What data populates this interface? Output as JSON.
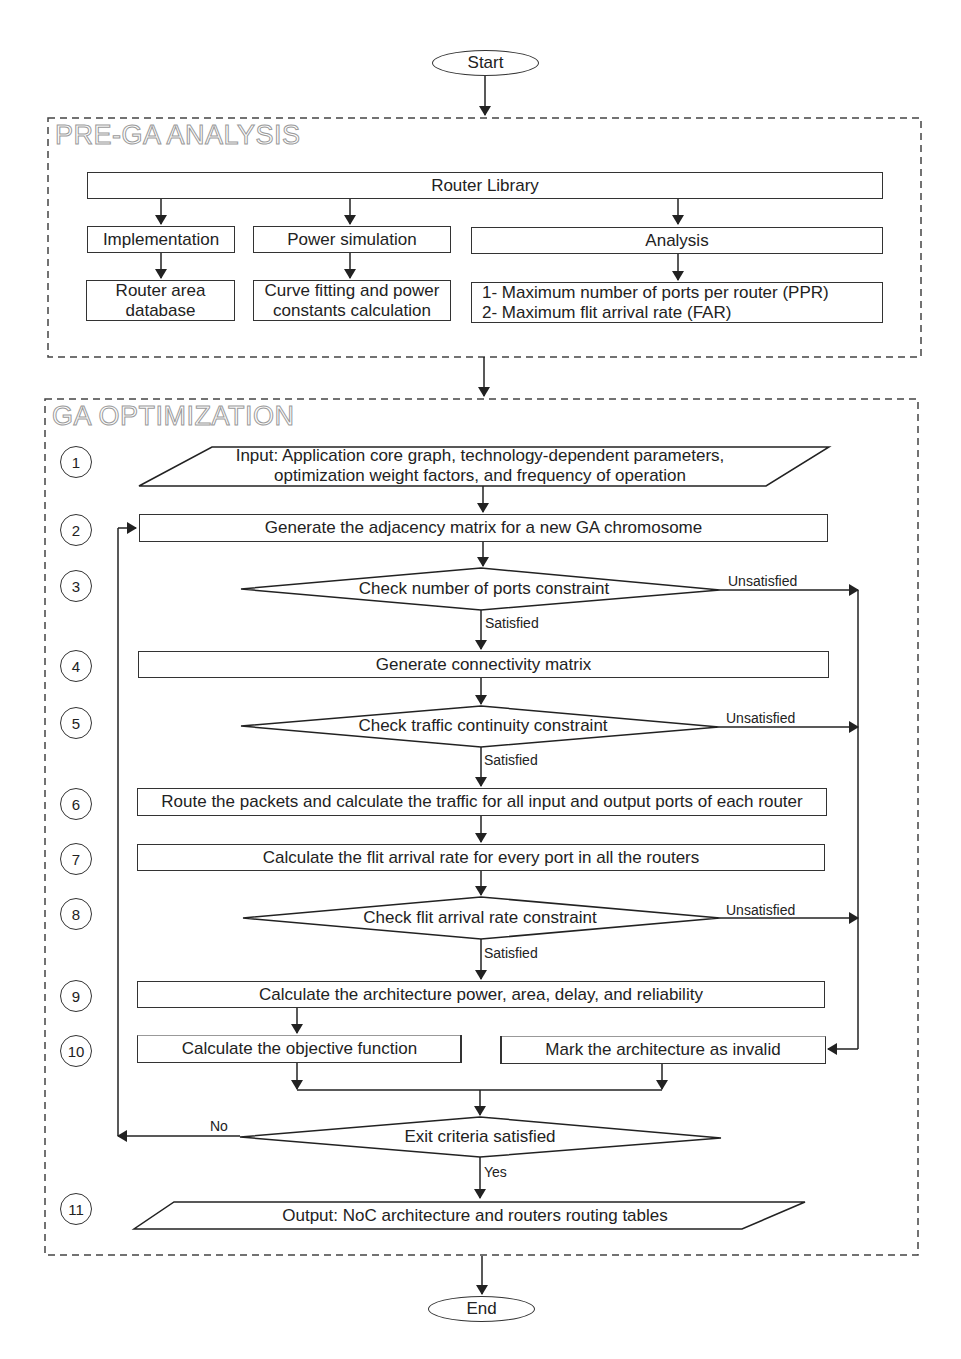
{
  "terminals": {
    "start": "Start",
    "end": "End"
  },
  "pre_ga": {
    "title": "PRE-GA ANALYSIS",
    "router_library": "Router Library",
    "columns": [
      {
        "header": "Implementation",
        "result_lines": [
          "Router area",
          "database"
        ]
      },
      {
        "header": "Power simulation",
        "result_lines": [
          "Curve fitting and power",
          "constants calculation"
        ]
      },
      {
        "header": "Analysis",
        "result_lines": [
          "1- Maximum number of ports per router (PPR)",
          "2- Maximum flit arrival rate (FAR)"
        ]
      }
    ]
  },
  "ga": {
    "title": "GA OPTIMIZATION",
    "steps": [
      {
        "num": "1",
        "shape": "io",
        "lines": [
          "Input: Application core graph, technology-dependent parameters,",
          "optimization weight factors, and frequency of operation"
        ]
      },
      {
        "num": "2",
        "shape": "process",
        "text": "Generate the adjacency matrix for a new GA chromosome"
      },
      {
        "num": "3",
        "shape": "decision",
        "text": "Check number of ports constraint"
      },
      {
        "num": "4",
        "shape": "process",
        "text": "Generate connectivity matrix"
      },
      {
        "num": "5",
        "shape": "decision",
        "text": "Check traffic continuity constraint"
      },
      {
        "num": "6",
        "shape": "process",
        "text": "Route the packets and calculate the traffic for all input and output ports of each router"
      },
      {
        "num": "7",
        "shape": "process",
        "text": "Calculate the flit arrival rate for every port in all the routers"
      },
      {
        "num": "8",
        "shape": "decision",
        "text": "Check flit arrival rate constraint"
      },
      {
        "num": "9",
        "shape": "process",
        "text": "Calculate the architecture power, area, delay, and reliability"
      },
      {
        "num": "10",
        "shape": "process",
        "left_text": "Calculate the objective function",
        "right_text": "Mark the architecture as invalid"
      },
      {
        "num": "11",
        "shape": "io",
        "text": "Output: NoC architecture and routers routing tables"
      }
    ],
    "exit_decision": "Exit criteria satisfied",
    "edge_labels": {
      "satisfied": "Satisfied",
      "unsatisfied": "Unsatisfied",
      "yes": "Yes",
      "no": "No"
    }
  }
}
